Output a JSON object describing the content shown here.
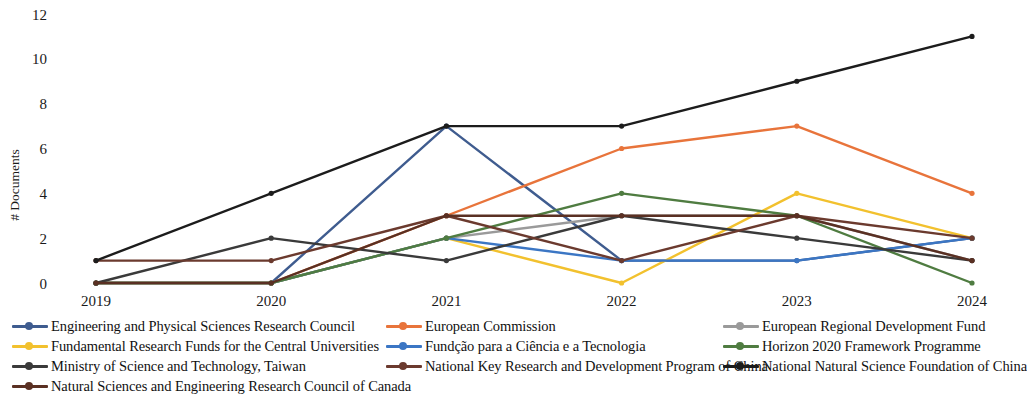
{
  "chart_data": {
    "type": "line",
    "title": "",
    "xlabel": "",
    "ylabel": "# Documents",
    "categories": [
      "2019",
      "2020",
      "2021",
      "2022",
      "2023",
      "2024"
    ],
    "x": [
      2019,
      2020,
      2021,
      2022,
      2023,
      2024
    ],
    "ylim": [
      0,
      12
    ],
    "yticks": [
      0,
      2,
      4,
      6,
      8,
      10,
      12
    ],
    "grid": false,
    "legend_position": "bottom",
    "markers": true,
    "series": [
      {
        "name": "Engineering and Physical Sciences Research Council",
        "color": "#3f5c8f",
        "values": [
          0,
          0,
          7,
          1,
          1,
          2
        ]
      },
      {
        "name": "European Commission",
        "color": "#e8743b",
        "values": [
          0,
          0,
          3,
          6,
          7,
          4
        ]
      },
      {
        "name": "European Regional Development Fund",
        "color": "#9a9a9a",
        "values": [
          0,
          0,
          2,
          3,
          3,
          1
        ]
      },
      {
        "name": "Fundamental Research Funds for the Central Universities",
        "color": "#f2c12e",
        "values": [
          0,
          0,
          2,
          0,
          4,
          2
        ]
      },
      {
        "name": "Fundção para a Ciência e a Tecnologia",
        "color": "#3b76c4",
        "values": [
          0,
          0,
          2,
          1,
          1,
          2
        ]
      },
      {
        "name": "Horizon 2020 Framework Programme",
        "color": "#4f7c41",
        "values": [
          0,
          0,
          2,
          4,
          3,
          0
        ]
      },
      {
        "name": "Ministry of Science and Technology, Taiwan",
        "color": "#3a3a3a",
        "values": [
          0,
          2,
          1,
          3,
          2,
          1
        ]
      },
      {
        "name": "National Key Research and Development Program of China",
        "color": "#6b3a2e",
        "values": [
          1,
          1,
          3,
          1,
          3,
          2
        ]
      },
      {
        "name": "National Natural Science Foundation of China",
        "color": "#1c1c1c",
        "values": [
          1,
          4,
          7,
          7,
          9,
          11
        ]
      },
      {
        "name": "Natural Sciences and Engineering Research Council of Canada",
        "color": "#5a3023",
        "values": [
          0,
          0,
          3,
          3,
          3,
          1
        ]
      }
    ]
  },
  "legend": {
    "entries": [
      {
        "label": "Engineering and Physical Sciences Research Council",
        "color": "#3f5c8f"
      },
      {
        "label": "European Commission",
        "color": "#e8743b"
      },
      {
        "label": "European Regional Development Fund",
        "color": "#9a9a9a"
      },
      {
        "label": "Fundamental Research Funds for the Central Universities",
        "color": "#f2c12e"
      },
      {
        "label": "Fundção para a Ciência e a Tecnologia",
        "color": "#3b76c4"
      },
      {
        "label": "Horizon 2020 Framework Programme",
        "color": "#4f7c41"
      },
      {
        "label": "Ministry of Science and Technology, Taiwan",
        "color": "#3a3a3a"
      },
      {
        "label": "National Key Research and Development Program of China",
        "color": "#6b3a2e"
      },
      {
        "label": "National Natural Science Foundation of China",
        "color": "#1c1c1c"
      },
      {
        "label": "Natural Sciences and Engineering Research Council of Canada",
        "color": "#5a3023"
      }
    ]
  }
}
